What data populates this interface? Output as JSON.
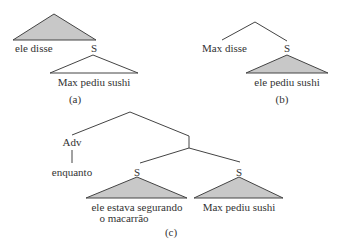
{
  "diagram": {
    "panels": [
      {
        "id": "a",
        "caption": "(a)",
        "labels": {
          "left_leaf": "ele disse",
          "node": "S",
          "subtree": "Max pediu sushi"
        },
        "triangles": {
          "top": "shaded",
          "bottom": "unshaded"
        }
      },
      {
        "id": "b",
        "caption": "(b)",
        "labels": {
          "left_leaf": "Max disse",
          "node": "S",
          "subtree": "ele pediu sushi"
        },
        "triangles": {
          "bottom": "shaded"
        }
      },
      {
        "id": "c",
        "caption": "(c)",
        "labels": {
          "adv": "Adv",
          "adv_leaf": "enquanto",
          "left_s": "S",
          "right_s": "S",
          "left_subtree_line1": "ele estava segurando",
          "left_subtree_line2": "o macarrão",
          "right_subtree": "Max pediu sushi"
        },
        "triangles": {
          "left": "shaded",
          "right": "shaded"
        }
      }
    ],
    "colors": {
      "line": "#444444",
      "shade": "#c8c8c8"
    }
  }
}
